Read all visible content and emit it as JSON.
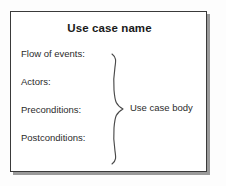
{
  "diagram": {
    "type": "uml-use-case-template",
    "title": "Use case name",
    "sections": [
      {
        "label": "Flow of events:"
      },
      {
        "label": "Actors:"
      },
      {
        "label": "Preconditions:"
      },
      {
        "label": "Postconditions:"
      }
    ],
    "annotation": {
      "label": "Use case body",
      "marker": "curly-brace"
    },
    "colors": {
      "background": "#fdfdfd",
      "box_fill": "#ffffff",
      "box_border": "#3a3a3a",
      "shadow": "#9a9a9a",
      "text": "#2b2b2b",
      "title_text": "#1a1a1a"
    }
  }
}
